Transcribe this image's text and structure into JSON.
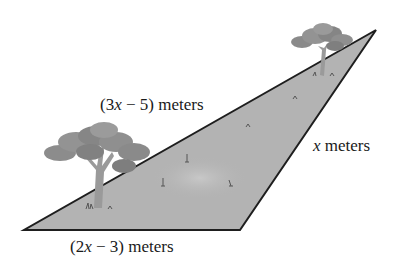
{
  "figure": {
    "colors": {
      "land_fill": "#b3b3b3",
      "land_highlight": "#c4c4c4",
      "edge": "#1e1e1e",
      "tree_foliage": "#8a8a8a",
      "tree_trunk": "#9a9a9a",
      "background": "#ffffff"
    },
    "triangle": {
      "vertices": [
        [
          24,
          230
        ],
        [
          240,
          230
        ],
        [
          376,
          30
        ]
      ]
    },
    "labels": {
      "hypotenuse": {
        "prefix": "(3",
        "var": "x",
        "suffix": " − 5) meters"
      },
      "right_side": {
        "prefix": "",
        "var": "x",
        "suffix": " meters"
      },
      "base": {
        "prefix": "(2",
        "var": "x",
        "suffix": " − 3) meters"
      }
    },
    "icons": [
      "tree-large-icon",
      "tree-small-icon",
      "grass-tuft-icon"
    ]
  }
}
